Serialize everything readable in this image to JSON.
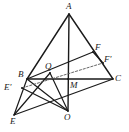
{
  "figure": {
    "width": 129,
    "height": 132,
    "background_color": "#ffffff",
    "stroke_color": "#1a1a1a",
    "dashed_stroke_color": "#555555"
  },
  "points": {
    "A": {
      "label": "A",
      "x": 69,
      "y": 14,
      "label_x": 66,
      "label_y": 2
    },
    "B": {
      "label": "B",
      "x": 27,
      "y": 79,
      "label_x": 18,
      "label_y": 70
    },
    "C": {
      "label": "C",
      "x": 113,
      "y": 79,
      "label_x": 115,
      "label_y": 74
    },
    "E": {
      "label": "E",
      "x": 14,
      "y": 115,
      "label_x": 10,
      "label_y": 117
    },
    "O": {
      "label": "O",
      "x": 68,
      "y": 111,
      "label_x": 64,
      "label_y": 113
    },
    "Q": {
      "label": "Q",
      "x": 50,
      "y": 73,
      "label_x": 45,
      "label_y": 62
    },
    "M": {
      "label": "M",
      "x": 68,
      "y": 79,
      "label_x": 70,
      "label_y": 81
    },
    "F": {
      "label": "F",
      "x": 93,
      "y": 52,
      "label_x": 95,
      "label_y": 43
    },
    "Fp": {
      "label": "F'",
      "x": 103,
      "y": 63,
      "label_x": 104,
      "label_y": 55
    },
    "Ep": {
      "label": "E'",
      "x": 22,
      "y": 88,
      "label_x": 4,
      "label_y": 83
    }
  },
  "segments": [
    {
      "name": "segment-A-B",
      "from": "A",
      "to": "B",
      "style": "solid",
      "width": 1.4
    },
    {
      "name": "segment-A-C",
      "from": "A",
      "to": "C",
      "style": "solid",
      "width": 1.4
    },
    {
      "name": "segment-B-C",
      "from": "B",
      "to": "C",
      "style": "solid",
      "width": 1.4
    },
    {
      "name": "segment-A-O",
      "from": "A",
      "to": "O",
      "style": "solid",
      "width": 1.4
    },
    {
      "name": "segment-B-F",
      "from": "B",
      "to": "F",
      "style": "solid",
      "width": 1.2
    },
    {
      "name": "segment-E-B",
      "from": "E",
      "to": "B",
      "style": "solid",
      "width": 1.2
    },
    {
      "name": "segment-E-Q",
      "from": "E",
      "to": "Q",
      "style": "solid",
      "width": 1.2
    },
    {
      "name": "segment-E-C",
      "from": "E",
      "to": "C",
      "style": "solid",
      "width": 1.2
    },
    {
      "name": "segment-O-B",
      "from": "O",
      "to": "B",
      "style": "solid",
      "width": 1.2
    },
    {
      "name": "segment-O-Q",
      "from": "O",
      "to": "Q",
      "style": "solid",
      "width": 1.2
    },
    {
      "name": "segment-O-Ep",
      "from": "O",
      "to": "Ep",
      "style": "solid",
      "width": 1.2
    },
    {
      "name": "segment-Ep-Fp",
      "from": "Ep",
      "to": "Fp",
      "style": "dashed",
      "width": 0.9
    },
    {
      "name": "segment-F-Fp",
      "from": "F",
      "to": "Fp",
      "style": "solid",
      "width": 1.2
    }
  ],
  "labels_order": [
    "A",
    "F",
    "Fp",
    "B",
    "Q",
    "Ep",
    "C",
    "M",
    "E",
    "O"
  ]
}
